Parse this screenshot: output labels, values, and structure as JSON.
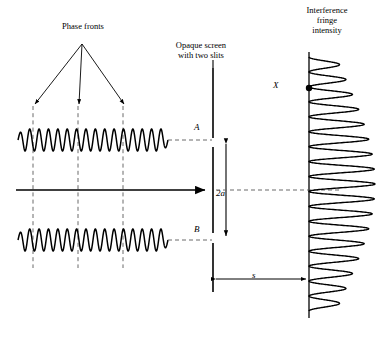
{
  "figure": {
    "background_color": "#ffffff",
    "stroke_color": "#000000",
    "dashed_color": "#555555",
    "width": 383,
    "height": 337
  },
  "labels": {
    "phase_fronts": "Phase fronts",
    "opaque_screen": "Opaque screen\nwith two slits",
    "interference": "Interference\nfringe\nintensity",
    "slit_a": "A",
    "slit_b": "B",
    "slit_separation": "2a",
    "screen_distance": "s",
    "point_x": "X"
  },
  "chart_data": {
    "type": "line",
    "xlabel": "",
    "ylabel": "",
    "grid": false,
    "legend": false,
    "annotations": [
      "Phase fronts",
      "Opaque screen with two slits",
      "Interference fringe intensity",
      "A",
      "B",
      "2a",
      "s",
      "X"
    ],
    "series": [
      {
        "name": "upper-wave-train",
        "role": "incident plane wave through slit A",
        "orientation": "horizontal",
        "baseline_y": 140,
        "x_start": 18,
        "x_end": 168,
        "amplitude": 11,
        "cycles": 16
      },
      {
        "name": "lower-wave-train",
        "role": "incident plane wave through slit B",
        "orientation": "horizontal",
        "baseline_y": 240,
        "x_start": 18,
        "x_end": 168,
        "amplitude": 11,
        "cycles": 16
      },
      {
        "name": "interference-fringe-intensity",
        "role": "intensity versus position on detection screen",
        "orientation": "vertical",
        "baseline_x": 309,
        "y_start": 57,
        "y_end": 311,
        "peak_count": 17,
        "max_amplitude": 66,
        "envelope": "central maximum, decaying toward edges"
      }
    ],
    "phase_front_x_positions": [
      33,
      78,
      123
    ],
    "optic_axis_y": 190,
    "screen_x": 213,
    "detector_x": 309,
    "slit_a_y": 143,
    "slit_b_y": 237
  }
}
